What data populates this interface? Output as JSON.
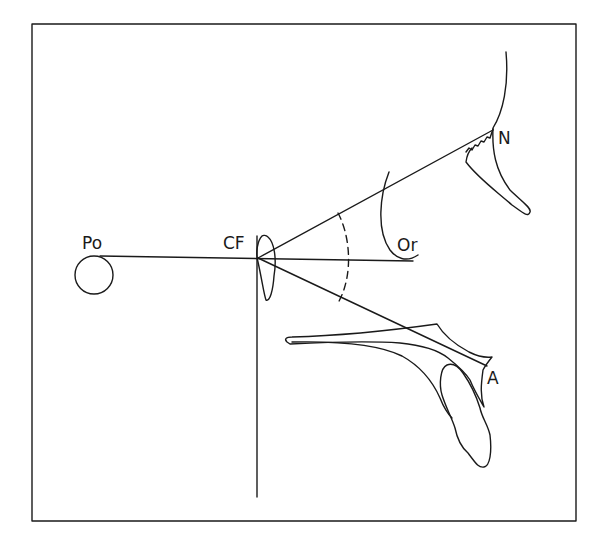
{
  "diagram": {
    "labels": {
      "po": "Po",
      "cf": "CF",
      "or": "Or",
      "n": "N",
      "a": "A"
    },
    "colors": {
      "stroke": "#1a1a1a",
      "background": "#ffffff"
    }
  }
}
